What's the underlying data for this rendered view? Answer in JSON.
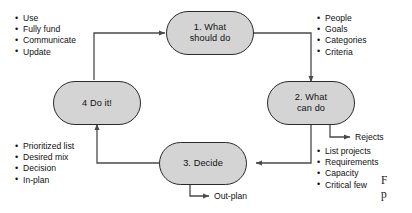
{
  "figure": {
    "nodes": [
      {
        "id": "n1",
        "line1": "1. What",
        "line2": "should do"
      },
      {
        "id": "n2",
        "line1": "2. What",
        "line2": "can do"
      },
      {
        "id": "n3",
        "line1": "3. Decide",
        "line2": ""
      },
      {
        "id": "n4",
        "line1": "4 Do it!",
        "line2": ""
      }
    ],
    "bullet_lists": [
      {
        "id": "do-it-outputs",
        "items": [
          "Use",
          "Fully fund",
          "Communicate",
          "Update"
        ]
      },
      {
        "id": "should-do-outputs",
        "items": [
          "People",
          "Goals",
          "Categories",
          "Criteria"
        ]
      },
      {
        "id": "decide-outputs",
        "items": [
          "Prioritized list",
          "Desired mix",
          "Decision",
          "In-plan"
        ]
      },
      {
        "id": "can-do-outputs",
        "items": [
          "List projects",
          "Requirements",
          "Capacity",
          "Critical few"
        ]
      }
    ],
    "branch_labels": [
      {
        "id": "rejects",
        "text": "Rejects"
      },
      {
        "id": "out-plan",
        "text": "Out-plan"
      }
    ],
    "caption": "F\npr",
    "caption_line1": "F",
    "caption_line2": "p",
    "colors": {
      "node_fill": "#d4d4d4",
      "node_stroke": "#2a2a2a",
      "wire": "#4a4a4a",
      "text": "#111111",
      "background": "#ffffff"
    }
  }
}
